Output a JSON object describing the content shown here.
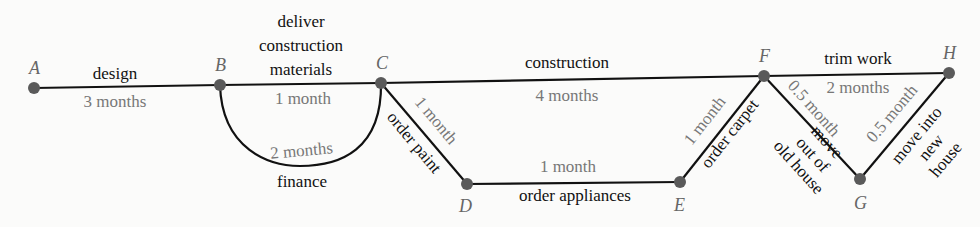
{
  "diagram": {
    "type": "activity network (project schedule)",
    "nodes": [
      {
        "id": "A",
        "x": 34,
        "y": 88
      },
      {
        "id": "B",
        "x": 220,
        "y": 85
      },
      {
        "id": "C",
        "x": 381,
        "y": 83
      },
      {
        "id": "D",
        "x": 467,
        "y": 184
      },
      {
        "id": "E",
        "x": 680,
        "y": 182
      },
      {
        "id": "F",
        "x": 764,
        "y": 76
      },
      {
        "id": "G",
        "x": 860,
        "y": 179
      },
      {
        "id": "H",
        "x": 949,
        "y": 73
      }
    ],
    "edges": [
      {
        "from": "A",
        "to": "B",
        "task": "design",
        "duration": "3 months"
      },
      {
        "from": "B",
        "to": "C",
        "task": "deliver construction materials",
        "task_lines": [
          "deliver",
          "construction",
          "materials"
        ],
        "duration": "1 month"
      },
      {
        "from": "B",
        "to": "C",
        "task": "finance",
        "duration": "2 months",
        "curved": true
      },
      {
        "from": "C",
        "to": "F",
        "task": "construction",
        "duration": "4 months"
      },
      {
        "from": "C",
        "to": "D",
        "task": "order paint",
        "duration": "1 month"
      },
      {
        "from": "D",
        "to": "E",
        "task": "order appliances",
        "duration": "1 month"
      },
      {
        "from": "E",
        "to": "F",
        "task": "order carpet",
        "duration": "1 month"
      },
      {
        "from": "F",
        "to": "H",
        "task": "trim work",
        "duration": "2 months"
      },
      {
        "from": "F",
        "to": "G",
        "task": "move out of old house",
        "task_lines": [
          "move",
          "out of",
          "old house"
        ],
        "duration": "0.5 month"
      },
      {
        "from": "G",
        "to": "H",
        "task": "move into new house",
        "task_lines": [
          "move into",
          "new",
          "house"
        ],
        "duration": "0.5 month"
      }
    ]
  },
  "labels": {
    "A": "A",
    "B": "B",
    "C": "C",
    "D": "D",
    "E": "E",
    "F": "F",
    "G": "G",
    "H": "H",
    "design": "design",
    "design_dur": "3 months",
    "deliver1": "deliver",
    "deliver2": "construction",
    "deliver3": "materials",
    "deliver_dur": "1 month",
    "finance": "finance",
    "finance_dur": "2 months",
    "construction": "construction",
    "construction_dur": "4 months",
    "paint": "order paint",
    "paint_dur": "1 month",
    "appliances": "order appliances",
    "appliances_dur": "1 month",
    "carpet": "order carpet",
    "carpet_dur": "1 month",
    "trim": "trim work",
    "trim_dur": "2 months",
    "moveout1": "move",
    "moveout2": "out of",
    "moveout3": "old house",
    "moveout_dur": "0.5 month",
    "movein1": "move into",
    "movein2": "new",
    "movein3": "house",
    "movein_dur": "0.5 month"
  },
  "colors": {
    "edge": "#111111",
    "node": "#5a5a5a",
    "duration_text": "#777777",
    "node_label": "#666666"
  }
}
